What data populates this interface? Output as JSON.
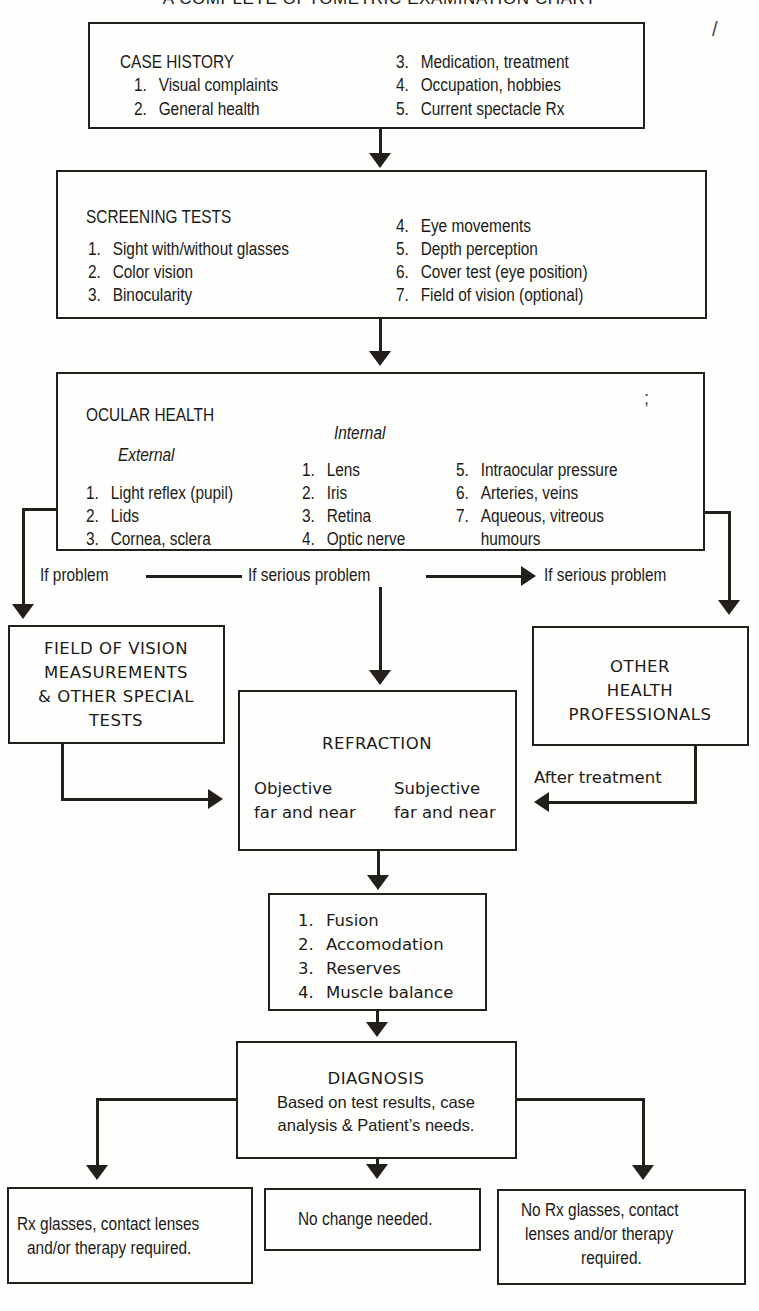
{
  "title": "A COMPLETE OPTOMETRIC EXAMINATION CHART",
  "case_history": {
    "heading": "CASE HISTORY",
    "items": [
      {
        "num": "1.",
        "label": "Visual complaints"
      },
      {
        "num": "2.",
        "label": "General health"
      },
      {
        "num": "3.",
        "label": "Medication, treatment"
      },
      {
        "num": "4.",
        "label": "Occupation, hobbies"
      },
      {
        "num": "5.",
        "label": "Current spectacle Rx"
      }
    ]
  },
  "screening_tests": {
    "heading": "SCREENING TESTS",
    "items": [
      {
        "num": "1.",
        "label": "Sight with/without glasses"
      },
      {
        "num": "2.",
        "label": "Color vision"
      },
      {
        "num": "3.",
        "label": "Binocularity"
      },
      {
        "num": "4.",
        "label": "Eye movements"
      },
      {
        "num": "5.",
        "label": "Depth perception"
      },
      {
        "num": "6.",
        "label": "Cover test (eye position)"
      },
      {
        "num": "7.",
        "label": "Field of vision (optional)"
      }
    ]
  },
  "ocular_health": {
    "heading": "OCULAR HEALTH",
    "external": {
      "heading": "External",
      "items": [
        {
          "num": "1.",
          "label": "Light reflex (pupil)"
        },
        {
          "num": "2.",
          "label": "Lids"
        },
        {
          "num": "3.",
          "label": "Cornea, sclera"
        }
      ]
    },
    "internal": {
      "heading": "Internal",
      "items": [
        {
          "num": "1.",
          "label": "Lens"
        },
        {
          "num": "2.",
          "label": "Iris"
        },
        {
          "num": "3.",
          "label": "Retina"
        },
        {
          "num": "4.",
          "label": "Optic nerve"
        },
        {
          "num": "5.",
          "label": "Intraocular pressure"
        },
        {
          "num": "6.",
          "label": "Arteries, veins"
        },
        {
          "num": "7.",
          "label": "Aqueous, vitreous"
        },
        {
          "num": "",
          "label": "humours"
        }
      ]
    }
  },
  "branch_labels": {
    "if_problem": "If problem",
    "if_serious_problem_center": "If serious problem",
    "if_serious_problem_right": "If serious problem",
    "after_treatment": "After treatment"
  },
  "field_of_vision": {
    "lines": [
      "FIELD OF VISION",
      "MEASUREMENTS",
      "& OTHER SPECIAL",
      "TESTS"
    ]
  },
  "other_health": {
    "lines": [
      "OTHER",
      "HEALTH",
      "PROFESSIONALS"
    ]
  },
  "refraction": {
    "heading": "REFRACTION",
    "objective": [
      "Objective",
      "far and near"
    ],
    "subjective": [
      "Subjective",
      "far and near"
    ]
  },
  "binocular_tests": {
    "items": [
      {
        "num": "1.",
        "label": "Fusion"
      },
      {
        "num": "2.",
        "label": "Accomodation"
      },
      {
        "num": "3.",
        "label": "Reserves"
      },
      {
        "num": "4.",
        "label": "Muscle balance"
      }
    ]
  },
  "diagnosis": {
    "heading": "DIAGNOSIS",
    "lines": [
      "Based on test results, case",
      "analysis & Patient’s needs."
    ]
  },
  "outcomes": {
    "left": [
      "Rx glasses, contact lenses",
      "and/or therapy required."
    ],
    "center": [
      "No change needed."
    ],
    "right": [
      "No Rx glasses, contact",
      "lenses and/or therapy",
      "required."
    ]
  },
  "colors": {
    "ink": "#221f1c",
    "paper": "#fefefc"
  }
}
